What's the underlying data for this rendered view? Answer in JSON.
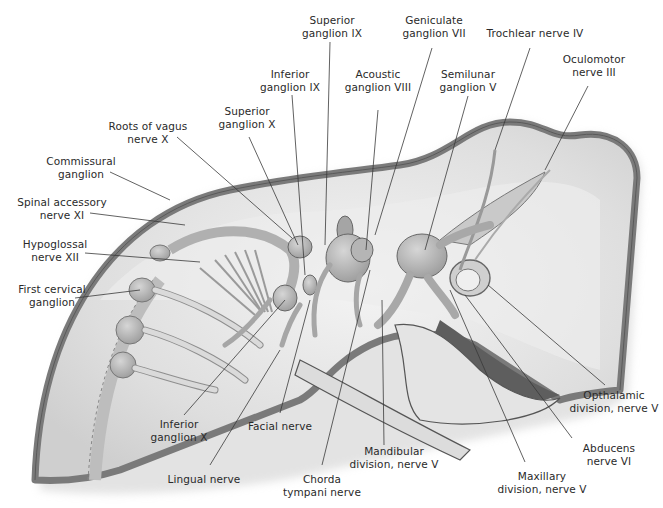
{
  "diagram": {
    "colors": {
      "background": "#ffffff",
      "body_outline": "#7a7a7a",
      "body_fill": "#e6e6e6",
      "ganglion_fill": "#bdbdbd",
      "nerve_fill": "#d9d9d9",
      "dark_region": "#5e5e5e",
      "leader_line": "#3a3a3a",
      "label_text": "#2a2a2a"
    },
    "labels": [
      {
        "id": "superior-ganglion-ix",
        "line1": "Superior",
        "line2": "ganglion IX"
      },
      {
        "id": "geniculate-ganglion-vii",
        "line1": "Geniculate",
        "line2": "ganglion VII"
      },
      {
        "id": "trochlear-nerve-iv",
        "line1": "Trochlear nerve IV",
        "line2": ""
      },
      {
        "id": "oculomotor-nerve-iii",
        "line1": "Oculomotor",
        "line2": "nerve III"
      },
      {
        "id": "inferior-ganglion-ix",
        "line1": "Inferior",
        "line2": "ganglion IX"
      },
      {
        "id": "acoustic-ganglion-viii",
        "line1": "Acoustic",
        "line2": "ganglion VIII"
      },
      {
        "id": "semilunar-ganglion-v",
        "line1": "Semilunar",
        "line2": "ganglion V"
      },
      {
        "id": "superior-ganglion-x",
        "line1": "Superior",
        "line2": "ganglion X"
      },
      {
        "id": "roots-of-vagus-nerve-x",
        "line1": "Roots of vagus",
        "line2": "nerve X"
      },
      {
        "id": "commissural-ganglion",
        "line1": "Commissural",
        "line2": "ganglion"
      },
      {
        "id": "spinal-accessory-nerve-xi",
        "line1": "Spinal accessory",
        "line2": "nerve XI"
      },
      {
        "id": "hypoglossal-nerve-xii",
        "line1": "Hypoglossal",
        "line2": "nerve XII"
      },
      {
        "id": "first-cervical-ganglion",
        "line1": "First cervical",
        "line2": "ganglion"
      },
      {
        "id": "inferior-ganglion-x",
        "line1": "Inferior",
        "line2": "ganglion X"
      },
      {
        "id": "facial-nerve",
        "line1": "Facial nerve",
        "line2": ""
      },
      {
        "id": "lingual-nerve",
        "line1": "Lingual nerve",
        "line2": ""
      },
      {
        "id": "chorda-tympani-nerve",
        "line1": "Chorda",
        "line2": "tympani nerve"
      },
      {
        "id": "mandibular-division-nerve-v",
        "line1": "Mandibular",
        "line2": "division, nerve V"
      },
      {
        "id": "maxillary-division-nerve-v",
        "line1": "Maxillary",
        "line2": "division, nerve V"
      },
      {
        "id": "abducens-nerve-vi",
        "line1": "Abducens",
        "line2": "nerve VI"
      },
      {
        "id": "opthalamic-division-nerve-v",
        "line1": "Opthalamic",
        "line2": "division, nerve V"
      }
    ]
  }
}
